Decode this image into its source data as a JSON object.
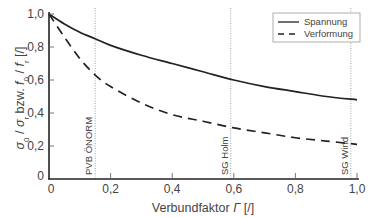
{
  "chart_data": {
    "type": "line",
    "title": "",
    "xlabel": "Verbundfaktor Γ [/]",
    "ylabel": "σ0 / σr bzw. f0 / fr [/]",
    "xlim": [
      0,
      1.0
    ],
    "ylim": [
      0,
      1.0
    ],
    "grid": false,
    "legend_position": "upper right",
    "x_ticks": [
      "0",
      "0,2",
      "0,4",
      "0,6",
      "0,8",
      "1,0"
    ],
    "y_ticks": [
      "0",
      "0,2",
      "0,4",
      "0,6",
      "0,8",
      "1,0"
    ],
    "x": [
      0,
      0.05,
      0.1,
      0.15,
      0.2,
      0.3,
      0.4,
      0.5,
      0.6,
      0.7,
      0.8,
      0.9,
      1.0
    ],
    "series": [
      {
        "name": "Spannung",
        "style": "solid",
        "values": [
          1.0,
          0.94,
          0.89,
          0.85,
          0.81,
          0.75,
          0.7,
          0.65,
          0.6,
          0.56,
          0.53,
          0.5,
          0.48
        ]
      },
      {
        "name": "Verformung",
        "style": "dashed",
        "values": [
          1.0,
          0.86,
          0.73,
          0.63,
          0.56,
          0.46,
          0.39,
          0.35,
          0.31,
          0.28,
          0.25,
          0.23,
          0.21
        ]
      }
    ],
    "annotations": [
      {
        "label": "PVB ÖNORM",
        "x": 0.15,
        "style": "vertical dotted line"
      },
      {
        "label": "SG Holm",
        "x": 0.59,
        "style": "vertical dotted line"
      },
      {
        "label": "SG Wind",
        "x": 0.98,
        "style": "vertical dotted line"
      }
    ]
  },
  "axes": {
    "xlabel_text": "Verbundfaktor ",
    "xlabel_symbol": "Γ",
    "xlabel_unit": " [/]",
    "ylabel_sigma": "σ",
    "ylabel_sub0": "0",
    "ylabel_slash": " / ",
    "ylabel_subr": "r",
    "ylabel_bzw": " bzw. ",
    "ylabel_f": "f",
    "ylabel_unit": " [/]"
  },
  "legend": {
    "items": [
      {
        "label": "Spannung"
      },
      {
        "label": "Verformung"
      }
    ]
  }
}
